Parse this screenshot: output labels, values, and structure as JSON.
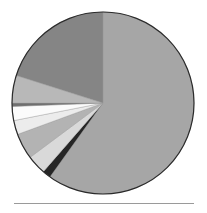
{
  "chart_data": {
    "type": "pie",
    "title": "",
    "start_angle_deg": 0,
    "direction": "clockwise",
    "center": [
      103,
      103
    ],
    "radius": 91,
    "legend": "none",
    "slices": [
      {
        "label": "",
        "value": 59.9,
        "color": "#a6a6a6"
      },
      {
        "label": "",
        "value": 1.5,
        "color": "#262626"
      },
      {
        "label": "",
        "value": 3.4,
        "color": "#d9d9d9"
      },
      {
        "label": "",
        "value": 4.6,
        "color": "#b3b3b3"
      },
      {
        "label": "",
        "value": 2.5,
        "color": "#ececec"
      },
      {
        "label": "",
        "value": 2.5,
        "color": "#fbfbfb"
      },
      {
        "label": "",
        "value": 0.6,
        "color": "#6e6e6e"
      },
      {
        "label": "",
        "value": 4.9,
        "color": "#b8b8b8"
      },
      {
        "label": "",
        "value": 20.1,
        "color": "#858585"
      }
    ],
    "outline_color": "#2b2b2b"
  }
}
